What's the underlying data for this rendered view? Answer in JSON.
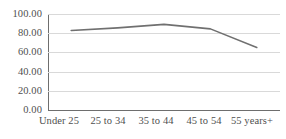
{
  "chart_data": {
    "type": "line",
    "title": "",
    "subtitle": "",
    "xlabel": "",
    "ylabel": "",
    "categories": [
      "Under 25",
      "25 to 34",
      "35 to 44",
      "45 to 54",
      "55 years+"
    ],
    "series": [
      {
        "name": "Series 1",
        "values": [
          82.8,
          85.5,
          89.2,
          84.5,
          65.1
        ],
        "color": "#707070"
      }
    ],
    "ylim": [
      0,
      100
    ],
    "ytick_values": [
      0,
      20,
      40,
      60,
      80,
      100
    ],
    "ytick_labels": [
      "0.00",
      "20.00",
      "40.00",
      "60.00",
      "80.00",
      "100.00"
    ],
    "grid": true,
    "grid_color": "#d9d9d9",
    "axis_color": "#6e6e6e",
    "legend": false,
    "legend_position": "none",
    "markers": false,
    "line_width": 1.6,
    "background": "#ffffff"
  }
}
